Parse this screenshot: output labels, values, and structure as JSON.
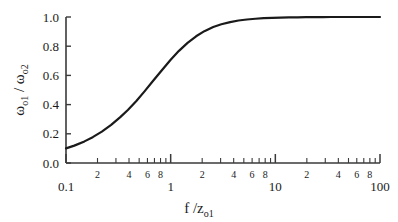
{
  "chart_data": {
    "type": "line",
    "title": "",
    "xlabel": "f /z_o1",
    "xlabel_main": "f /z",
    "xlabel_sub": "o1",
    "ylabel": "ω_o2 / ω_o1",
    "ylabel_omega": "ω",
    "ylabel_sub1": "o2",
    "ylabel_slash": " / ",
    "ylabel_sub2": "o1",
    "xscale": "log",
    "yscale": "linear",
    "xlim": [
      0.1,
      100
    ],
    "ylim": [
      0.0,
      1.0
    ],
    "grid": false,
    "legend": "none",
    "line_color": "#1a1a1a",
    "line_width": 2.2,
    "background": "#ffffff",
    "axis_color": "#3a3a3a",
    "x_major_ticks": [
      0.1,
      1,
      10,
      100
    ],
    "x_major_tick_labels": [
      "0.1",
      "1",
      "10",
      "100"
    ],
    "x_minor_tick_labels": [
      {
        "value": 0.2,
        "label": "2"
      },
      {
        "value": 0.4,
        "label": "4"
      },
      {
        "value": 0.6,
        "label": "6"
      },
      {
        "value": 0.8,
        "label": "8"
      },
      {
        "value": 2,
        "label": "2"
      },
      {
        "value": 4,
        "label": "4"
      },
      {
        "value": 6,
        "label": "6"
      },
      {
        "value": 8,
        "label": "8"
      },
      {
        "value": 20,
        "label": "2"
      },
      {
        "value": 40,
        "label": "4"
      },
      {
        "value": 60,
        "label": "6"
      },
      {
        "value": 80,
        "label": "8"
      }
    ],
    "x_minor_ticks": [
      0.2,
      0.3,
      0.4,
      0.5,
      0.6,
      0.7,
      0.8,
      0.9,
      2,
      3,
      4,
      5,
      6,
      7,
      8,
      9,
      20,
      30,
      40,
      50,
      60,
      70,
      80,
      90
    ],
    "y_major_ticks": [
      0.0,
      0.2,
      0.4,
      0.6,
      0.8,
      1.0
    ],
    "y_major_tick_labels": [
      "0.0",
      "0.2",
      "0.4",
      "0.6",
      "0.8",
      "1.0"
    ],
    "series": [
      {
        "name": "omega_o2 / omega_o1",
        "x": [
          0.1,
          0.12,
          0.15,
          0.18,
          0.22,
          0.27,
          0.33,
          0.39,
          0.47,
          0.56,
          0.68,
          0.82,
          1.0,
          1.2,
          1.45,
          1.75,
          2.1,
          2.55,
          3.05,
          3.7,
          4.45,
          5.35,
          6.45,
          7.75,
          9.35,
          11.2,
          13.5,
          16.3,
          19.6,
          23.6,
          28.4,
          34.2,
          41.2,
          49.6,
          59.7,
          71.9,
          86.6,
          100.0
        ],
        "y": [
          0.1,
          0.119,
          0.148,
          0.177,
          0.215,
          0.261,
          0.314,
          0.363,
          0.425,
          0.489,
          0.563,
          0.634,
          0.707,
          0.768,
          0.823,
          0.868,
          0.903,
          0.931,
          0.95,
          0.965,
          0.976,
          0.983,
          0.988,
          0.992,
          0.994,
          0.996,
          0.997,
          0.998,
          0.999,
          0.999,
          0.999,
          1.0,
          1.0,
          1.0,
          1.0,
          1.0,
          1.0,
          1.0
        ]
      }
    ]
  },
  "plot_geometry": {
    "left": 66,
    "right": 380,
    "top": 17,
    "bottom": 163
  }
}
